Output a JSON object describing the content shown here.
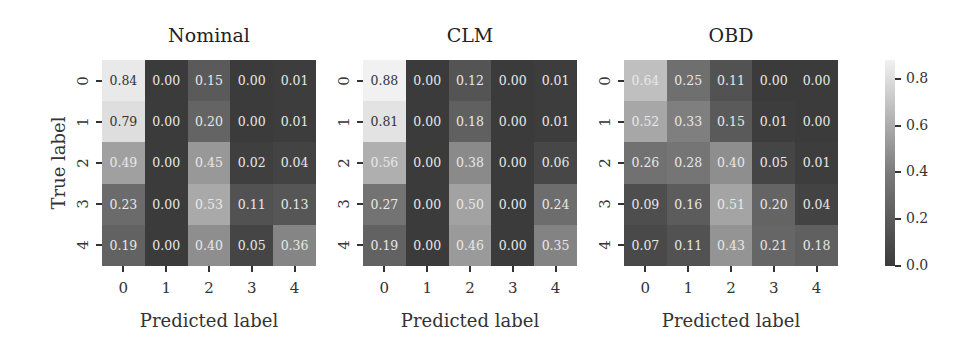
{
  "chart_data": {
    "type": "heatmap",
    "title": "",
    "ylabel": "True label",
    "xlabel": "Predicted label",
    "row_labels": [
      "0",
      "1",
      "2",
      "3",
      "4"
    ],
    "col_labels": [
      "0",
      "1",
      "2",
      "3",
      "4"
    ],
    "colorbar": {
      "ticks": [
        "0.0",
        "0.2",
        "0.4",
        "0.6",
        "0.8"
      ],
      "range": [
        0.0,
        0.88
      ],
      "colormap": "gray"
    },
    "panels": [
      {
        "title": "Nominal",
        "values": [
          [
            0.84,
            0.0,
            0.15,
            0.0,
            0.01
          ],
          [
            0.79,
            0.0,
            0.2,
            0.0,
            0.01
          ],
          [
            0.49,
            0.0,
            0.45,
            0.02,
            0.04
          ],
          [
            0.23,
            0.0,
            0.53,
            0.11,
            0.13
          ],
          [
            0.19,
            0.0,
            0.4,
            0.05,
            0.36
          ]
        ]
      },
      {
        "title": "CLM",
        "values": [
          [
            0.88,
            0.0,
            0.12,
            0.0,
            0.01
          ],
          [
            0.81,
            0.0,
            0.18,
            0.0,
            0.01
          ],
          [
            0.56,
            0.0,
            0.38,
            0.0,
            0.06
          ],
          [
            0.27,
            0.0,
            0.5,
            0.0,
            0.24
          ],
          [
            0.19,
            0.0,
            0.46,
            0.0,
            0.35
          ]
        ]
      },
      {
        "title": "OBD",
        "values": [
          [
            0.64,
            0.25,
            0.11,
            0.0,
            0.0
          ],
          [
            0.52,
            0.33,
            0.15,
            0.01,
            0.0
          ],
          [
            0.26,
            0.28,
            0.4,
            0.05,
            0.01
          ],
          [
            0.09,
            0.16,
            0.51,
            0.2,
            0.04
          ],
          [
            0.07,
            0.11,
            0.43,
            0.21,
            0.18
          ]
        ]
      }
    ]
  },
  "layout": {
    "panel_lefts": [
      102,
      363,
      624
    ]
  }
}
